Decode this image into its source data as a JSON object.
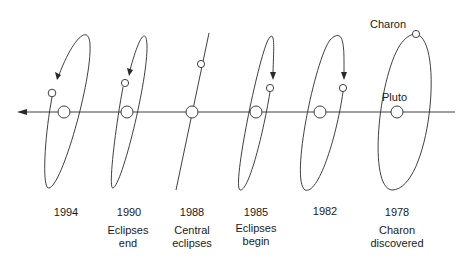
{
  "diagram": {
    "type": "Pluto-Charon mutual event geometry over time",
    "direction": "right-to-left (arrow points left, toward later years)",
    "labels": {
      "charon": "Charon",
      "pluto": "Pluto"
    },
    "epochs": [
      {
        "year": "1994",
        "caption_line1": "",
        "caption_line2": "",
        "x": 64
      },
      {
        "year": "1990",
        "caption_line1": "Eclipses",
        "caption_line2": "end",
        "x": 127
      },
      {
        "year": "1988",
        "caption_line1": "Central",
        "caption_line2": "eclipses",
        "x": 192
      },
      {
        "year": "1985",
        "caption_line1": "Eclipses",
        "caption_line2": "begin",
        "x": 256
      },
      {
        "year": "1982",
        "caption_line1": "",
        "caption_line2": "",
        "x": 320
      },
      {
        "year": "1978",
        "caption_line1": "Charon",
        "caption_line2": "discovered",
        "x": 397
      }
    ],
    "colors": {
      "line": "#2a2a2a",
      "text": "#1a1a1a",
      "background": "#ffffff"
    }
  }
}
